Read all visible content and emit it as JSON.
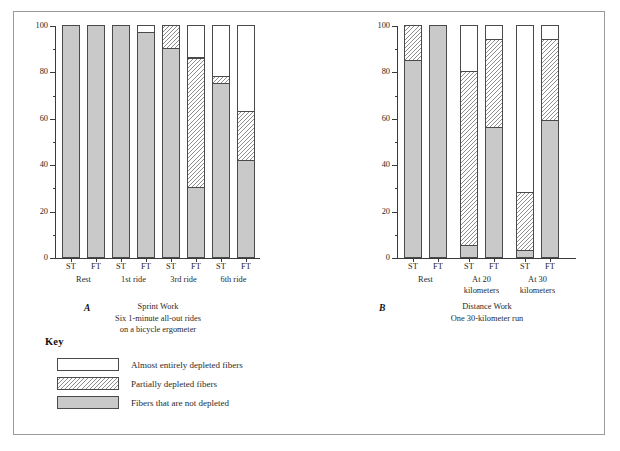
{
  "chart_data": {
    "type": "bar",
    "title": "",
    "ylabel": "Percentage of Glycogen Stored in Slow Twitch\nand Fast Twitch Muscle Fibers",
    "ylim": [
      0,
      100
    ],
    "yticks": [
      0,
      20,
      40,
      60,
      80,
      100
    ],
    "ytick_labels": [
      "0",
      "20",
      "40",
      "60",
      "80",
      "100"
    ],
    "yminor_step": 10,
    "grid": false,
    "legend_position": "below-left",
    "stacking": "percent",
    "series": [
      {
        "name": "Fibers that are not depleted",
        "key": "full",
        "style": "solid-gray"
      },
      {
        "name": "Partially depleted fibers",
        "key": "partial",
        "style": "diagonal-hatch"
      },
      {
        "name": "Almost entirely depleted fibers",
        "key": "empty",
        "style": "white"
      }
    ],
    "panels": [
      {
        "letter": "A",
        "xlabel": "Sprint Work",
        "sublabel": "Six 1-minute all-out rides\non a bicycle ergometer",
        "groups": [
          {
            "label": "Rest",
            "bars": [
              {
                "label": "ST",
                "full": 100,
                "partial": 0,
                "empty": 0
              },
              {
                "label": "FT",
                "full": 100,
                "partial": 0,
                "empty": 0
              }
            ]
          },
          {
            "label": "1st ride",
            "bars": [
              {
                "label": "ST",
                "full": 100,
                "partial": 0,
                "empty": 0
              },
              {
                "label": "FT",
                "full": 97,
                "partial": 0,
                "empty": 3
              }
            ]
          },
          {
            "label": "3rd ride",
            "bars": [
              {
                "label": "ST",
                "full": 90,
                "partial": 10,
                "empty": 0
              },
              {
                "label": "FT",
                "full": 30,
                "partial": 56,
                "empty": 14
              }
            ]
          },
          {
            "label": "6th ride",
            "bars": [
              {
                "label": "ST",
                "full": 75,
                "partial": 3,
                "empty": 22
              },
              {
                "label": "FT",
                "full": 42,
                "partial": 21,
                "empty": 37
              }
            ]
          }
        ]
      },
      {
        "letter": "B",
        "xlabel": "Distance Work",
        "sublabel": "One 30-kilometer run",
        "groups": [
          {
            "label": "Rest",
            "bars": [
              {
                "label": "ST",
                "full": 85,
                "partial": 15,
                "empty": 0
              },
              {
                "label": "FT",
                "full": 100,
                "partial": 0,
                "empty": 0
              }
            ]
          },
          {
            "label": "At 20\nkilometers",
            "bars": [
              {
                "label": "ST",
                "full": 5,
                "partial": 75,
                "empty": 20
              },
              {
                "label": "FT",
                "full": 56,
                "partial": 38,
                "empty": 6
              }
            ]
          },
          {
            "label": "At 30\nkilometers",
            "bars": [
              {
                "label": "ST",
                "full": 3,
                "partial": 25,
                "empty": 72
              },
              {
                "label": "FT",
                "full": 59,
                "partial": 35,
                "empty": 6
              }
            ]
          }
        ]
      }
    ]
  },
  "key": {
    "title": "Key",
    "entries": [
      {
        "label": "Almost entirely depleted fibers",
        "style": "empty"
      },
      {
        "label": "Partially depleted fibers",
        "style": "partial"
      },
      {
        "label": "Fibers that are not depleted",
        "style": "full"
      }
    ]
  },
  "colors": {
    "fill_full": "#c9c9c9",
    "fill_empty": "#ffffff",
    "hatch_line": "#8d8d8d",
    "outline": "#4a4a4a",
    "axis": "#3a3a3a",
    "frame": "#9a9a9a",
    "text": "#2a2a2a"
  }
}
